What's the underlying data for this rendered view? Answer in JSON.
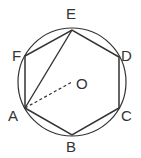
{
  "diagram": {
    "labels": {
      "A": "A",
      "B": "B",
      "C": "C",
      "D": "D",
      "E": "E",
      "F": "F",
      "O": "O"
    },
    "colors": {
      "stroke": "#333333",
      "background": "#ffffff"
    }
  }
}
